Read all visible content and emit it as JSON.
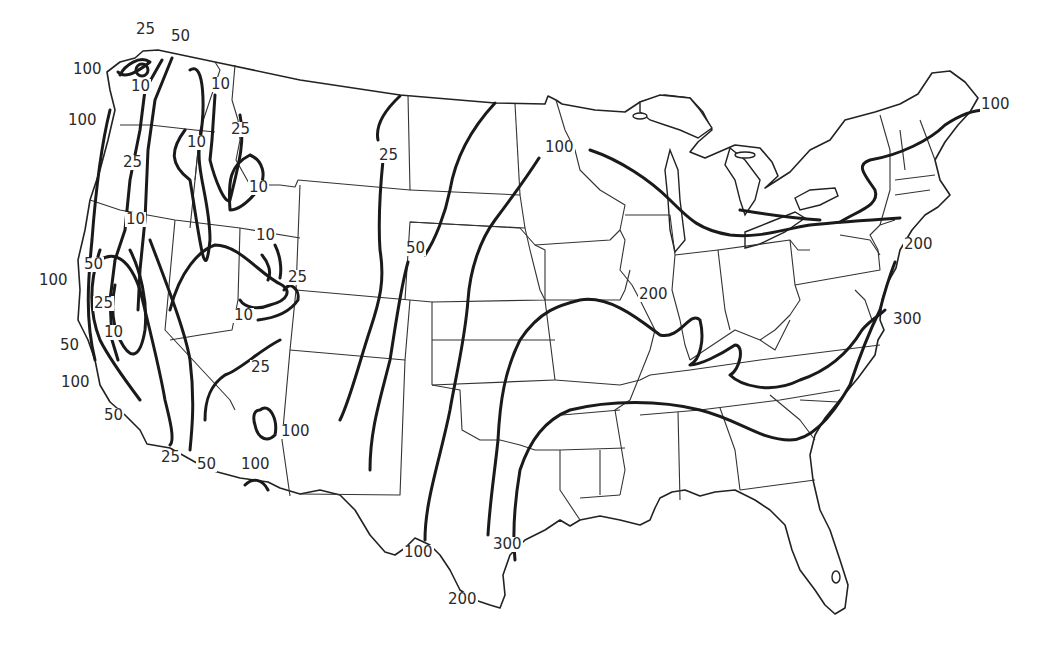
{
  "map": {
    "subject": "Contiguous United States isoline map",
    "colors": {
      "background": "#ffffff",
      "line": "#1a1a1a"
    },
    "contour_values": [
      10,
      25,
      50,
      100,
      200,
      300
    ],
    "labels": [
      {
        "id": "l01",
        "text": "25",
        "x": 135,
        "y": 30
      },
      {
        "id": "l02",
        "text": "50",
        "x": 170,
        "y": 37
      },
      {
        "id": "l03",
        "text": "100",
        "x": 72,
        "y": 70
      },
      {
        "id": "l04",
        "text": "10",
        "x": 130,
        "y": 87
      },
      {
        "id": "l05",
        "text": "100",
        "x": 67,
        "y": 113
      },
      {
        "id": "l06",
        "text": "10",
        "x": 210,
        "y": 77
      },
      {
        "id": "l07",
        "text": "25",
        "x": 230,
        "y": 122
      },
      {
        "id": "l08",
        "text": "10",
        "x": 186,
        "y": 135
      },
      {
        "id": "l09",
        "text": "25",
        "x": 122,
        "y": 155
      },
      {
        "id": "l10",
        "text": "10",
        "x": 248,
        "y": 180
      },
      {
        "id": "l11",
        "text": "10",
        "x": 125,
        "y": 212
      },
      {
        "id": "l12",
        "text": "10",
        "x": 255,
        "y": 228
      },
      {
        "id": "l13",
        "text": "50",
        "x": 83,
        "y": 257
      },
      {
        "id": "l14",
        "text": "100",
        "x": 38,
        "y": 273
      },
      {
        "id": "l15",
        "text": "25",
        "x": 287,
        "y": 270
      },
      {
        "id": "l16",
        "text": "25",
        "x": 93,
        "y": 296
      },
      {
        "id": "l17",
        "text": "10",
        "x": 233,
        "y": 308
      },
      {
        "id": "l18",
        "text": "10",
        "x": 103,
        "y": 325
      },
      {
        "id": "l19",
        "text": "50",
        "x": 59,
        "y": 338
      },
      {
        "id": "l20",
        "text": "25",
        "x": 250,
        "y": 360
      },
      {
        "id": "l21",
        "text": "100",
        "x": 60,
        "y": 375
      },
      {
        "id": "l22",
        "text": "50",
        "x": 103,
        "y": 408
      },
      {
        "id": "l23",
        "text": "100",
        "x": 280,
        "y": 424
      },
      {
        "id": "l24",
        "text": "25",
        "x": 160,
        "y": 450
      },
      {
        "id": "l25",
        "text": "50",
        "x": 196,
        "y": 457
      },
      {
        "id": "l26",
        "text": "100",
        "x": 240,
        "y": 457
      },
      {
        "id": "l27",
        "text": "25",
        "x": 378,
        "y": 148
      },
      {
        "id": "l28",
        "text": "50",
        "x": 405,
        "y": 241
      },
      {
        "id": "l29",
        "text": "100",
        "x": 544,
        "y": 140
      },
      {
        "id": "l30",
        "text": "200",
        "x": 638,
        "y": 287
      },
      {
        "id": "l31",
        "text": "100",
        "x": 980,
        "y": 97
      },
      {
        "id": "l32",
        "text": "200",
        "x": 903,
        "y": 237
      },
      {
        "id": "l33",
        "text": "300",
        "x": 892,
        "y": 312
      },
      {
        "id": "l34",
        "text": "100",
        "x": 403,
        "y": 545
      },
      {
        "id": "l35",
        "text": "300",
        "x": 492,
        "y": 537
      },
      {
        "id": "l36",
        "text": "200",
        "x": 447,
        "y": 592
      }
    ]
  }
}
